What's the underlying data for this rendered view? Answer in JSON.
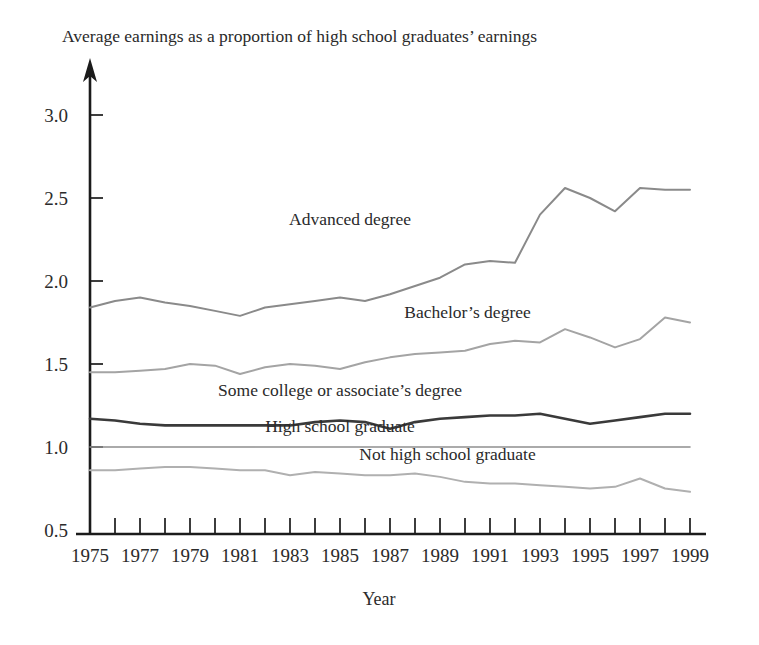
{
  "chart_data": {
    "type": "line",
    "title": "Average earnings as a proportion of high school graduates’ earnings",
    "xlabel": "Year",
    "ylabel": "",
    "xlim": [
      1975,
      1999
    ],
    "ylim": [
      0.5,
      3.0
    ],
    "grid": false,
    "legend_position": "inline-labels",
    "y_ticks": [
      "0.5",
      "1.0",
      "1.5",
      "2.0",
      "2.5",
      "3.0"
    ],
    "y_tick_values": [
      0.5,
      1.0,
      1.5,
      2.0,
      2.5,
      3.0
    ],
    "x_ticks": [
      "1975",
      "1977",
      "1979",
      "1981",
      "1983",
      "1985",
      "1987",
      "1989",
      "1991",
      "1993",
      "1995",
      "1997",
      "1999"
    ],
    "x_tick_values": [
      1975,
      1977,
      1979,
      1981,
      1983,
      1985,
      1987,
      1989,
      1991,
      1993,
      1995,
      1997,
      1999
    ],
    "x": [
      1975,
      1976,
      1977,
      1978,
      1979,
      1980,
      1981,
      1982,
      1983,
      1984,
      1985,
      1986,
      1987,
      1988,
      1989,
      1990,
      1991,
      1992,
      1993,
      1994,
      1995,
      1996,
      1997,
      1998,
      1999
    ],
    "series": [
      {
        "name": "Advanced degree",
        "color": "#8a8a8a",
        "width": 2.0,
        "label_x": 1985.4,
        "label_y": 2.34,
        "values": [
          1.84,
          1.88,
          1.9,
          1.87,
          1.85,
          1.82,
          1.79,
          1.84,
          1.86,
          1.88,
          1.9,
          1.88,
          1.92,
          1.97,
          2.02,
          2.1,
          2.12,
          2.11,
          2.4,
          2.56,
          2.5,
          2.42,
          2.56,
          2.55,
          2.55
        ]
      },
      {
        "name": "Bachelor’s degree",
        "color": "#a4a4a4",
        "width": 2.0,
        "label_x": 1990.1,
        "label_y": 1.78,
        "values": [
          1.45,
          1.45,
          1.46,
          1.47,
          1.5,
          1.49,
          1.44,
          1.48,
          1.5,
          1.49,
          1.47,
          1.51,
          1.54,
          1.56,
          1.57,
          1.58,
          1.62,
          1.64,
          1.63,
          1.71,
          1.66,
          1.6,
          1.65,
          1.78,
          1.75
        ]
      },
      {
        "name": "Some college or associate’s degree",
        "color": "#3a3a3a",
        "width": 2.6,
        "label_x": 1985.0,
        "label_y": 1.31,
        "values": [
          1.17,
          1.16,
          1.14,
          1.13,
          1.13,
          1.13,
          1.13,
          1.13,
          1.13,
          1.15,
          1.16,
          1.15,
          1.11,
          1.15,
          1.17,
          1.18,
          1.19,
          1.19,
          1.2,
          1.17,
          1.14,
          1.16,
          1.18,
          1.2,
          1.2
        ]
      },
      {
        "name": "High school graduate",
        "color": "#8f8f8f",
        "width": 1.6,
        "label_x": 1985.0,
        "label_y": 1.09,
        "values": [
          1.0,
          1.0,
          1.0,
          1.0,
          1.0,
          1.0,
          1.0,
          1.0,
          1.0,
          1.0,
          1.0,
          1.0,
          1.0,
          1.0,
          1.0,
          1.0,
          1.0,
          1.0,
          1.0,
          1.0,
          1.0,
          1.0,
          1.0,
          1.0,
          1.0
        ]
      },
      {
        "name": "Not high school graduate",
        "color": "#b0b0b0",
        "width": 2.0,
        "label_x": 1989.3,
        "label_y": 0.92,
        "values": [
          0.86,
          0.86,
          0.87,
          0.88,
          0.88,
          0.87,
          0.86,
          0.86,
          0.83,
          0.85,
          0.84,
          0.83,
          0.83,
          0.84,
          0.82,
          0.79,
          0.78,
          0.78,
          0.77,
          0.76,
          0.75,
          0.76,
          0.81,
          0.75,
          0.73
        ]
      }
    ]
  }
}
